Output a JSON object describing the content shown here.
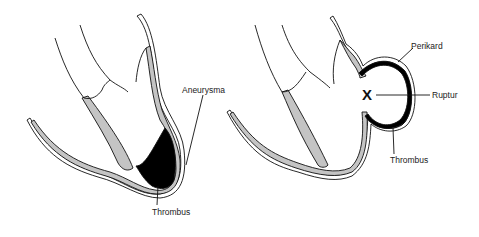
{
  "diagram": {
    "left_panel": {
      "labels": {
        "aneurysma": "Aneurysma",
        "thrombus": "Thrombus"
      }
    },
    "right_panel": {
      "labels": {
        "perikard": "Perikard",
        "ruptur": "Ruptur",
        "thrombus": "Thrombus",
        "rupture_mark": "X"
      }
    },
    "colors": {
      "myocardium": "#c4c4c4",
      "thrombus": "#000000",
      "outline": "#111111",
      "background": "#ffffff"
    }
  }
}
